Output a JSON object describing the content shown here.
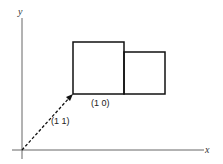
{
  "diagram": {
    "axes": {
      "x_label": "x",
      "y_label": "y"
    },
    "vector": {
      "label": "(1 1)",
      "style": "dashed-arrow",
      "from": "origin",
      "to": "corner-of-large-square"
    },
    "shapes": [
      {
        "name": "large-square",
        "kind": "square"
      },
      {
        "name": "small-rectangle",
        "kind": "rectangle"
      }
    ],
    "edge_label": "(1 0)",
    "colors": {
      "stroke": "#111111",
      "axis": "#555555",
      "background": "#ffffff"
    }
  }
}
